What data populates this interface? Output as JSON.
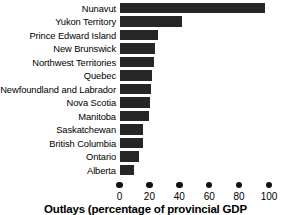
{
  "chart_data": {
    "type": "bar",
    "orientation": "horizontal",
    "title": "",
    "xlabel": "Outlays (percentage of provincial GDP",
    "ylabel": "",
    "xlim": [
      0,
      100
    ],
    "xticks": [
      0,
      20,
      40,
      60,
      80,
      100
    ],
    "xtick_labels": [
      "0",
      "20",
      "40",
      "60",
      "80",
      "100"
    ],
    "grid": false,
    "legend": false,
    "bar_color": "#262626",
    "categories": [
      "Nunavut",
      "Yukon Territory",
      "Prince Edward Island",
      "New Brunswick",
      "Northwest Territories",
      "Quebec",
      "Newfoundland and Labrador",
      "Nova Scotia",
      "Manitoba",
      "Saskatchewan",
      "British Columbia",
      "Ontario",
      "Alberta"
    ],
    "values": [
      97,
      42,
      26,
      24,
      23,
      22,
      21,
      20.5,
      20,
      16,
      16,
      13,
      10
    ]
  },
  "axis": {
    "title": "Outlays (percentage of provincial GDP"
  }
}
